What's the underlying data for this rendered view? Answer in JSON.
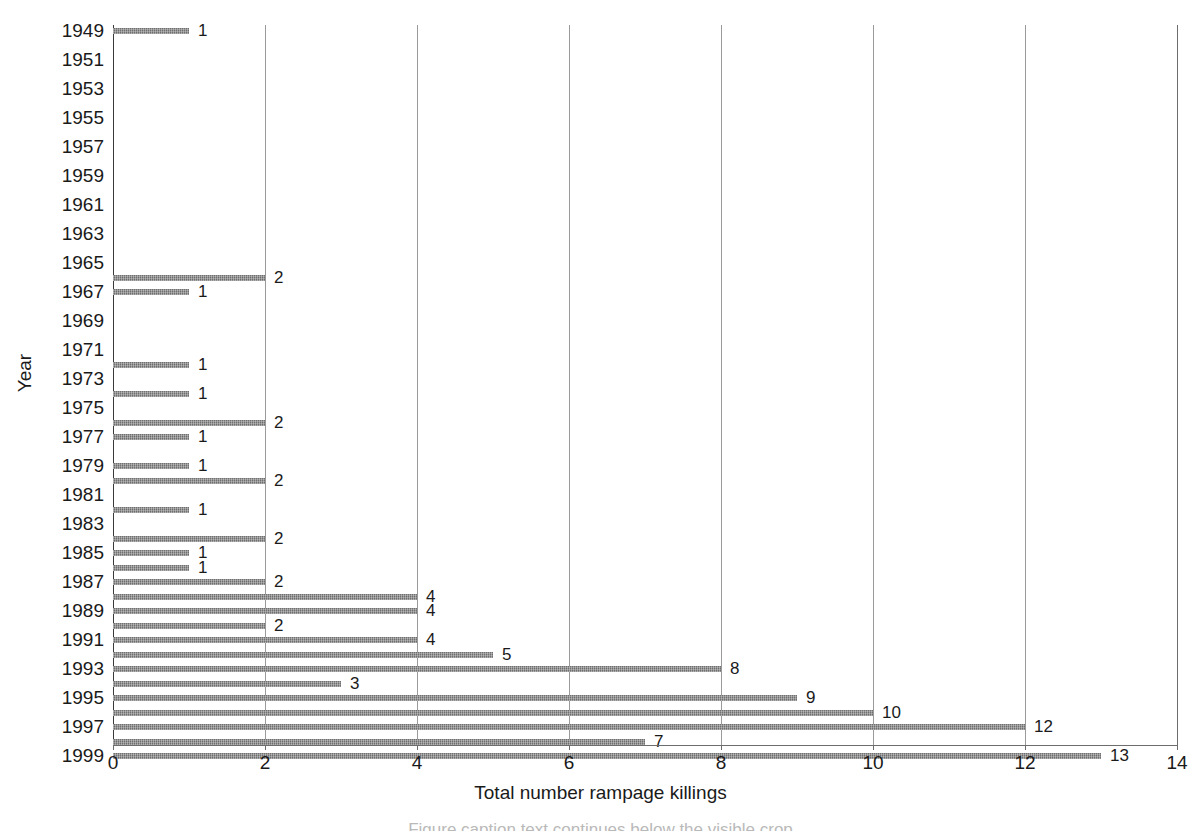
{
  "chart_data": {
    "type": "bar",
    "orientation": "horizontal",
    "title": "",
    "xlabel": "Total number rampage killings",
    "ylabel": "Year",
    "xlim": [
      0,
      14
    ],
    "ylim": [
      1949,
      1999
    ],
    "grid": true,
    "legend": false,
    "x_ticks": [
      0,
      2,
      4,
      6,
      8,
      10,
      12,
      14
    ],
    "x_tick_labels": [
      "0",
      "2",
      "4",
      "6",
      "8",
      "10",
      "12",
      "14"
    ],
    "y_tick_labels": [
      "1949",
      "1951",
      "1953",
      "1955",
      "1957",
      "1959",
      "1961",
      "1963",
      "1965",
      "1967",
      "1969",
      "1971",
      "1973",
      "1975",
      "1977",
      "1979",
      "1981",
      "1983",
      "1985",
      "1987",
      "1989",
      "1991",
      "1993",
      "1995",
      "1997",
      "1999"
    ],
    "bar_color": "#6f6f6f",
    "gridline_color": "#9a9a9a",
    "axis_color": "#6d6d6d",
    "categories": [
      "1949",
      "1950",
      "1951",
      "1952",
      "1953",
      "1954",
      "1955",
      "1956",
      "1957",
      "1958",
      "1959",
      "1960",
      "1961",
      "1962",
      "1963",
      "1964",
      "1965",
      "1966",
      "1967",
      "1968",
      "1969",
      "1970",
      "1971",
      "1972",
      "1973",
      "1974",
      "1975",
      "1976",
      "1977",
      "1978",
      "1979",
      "1980",
      "1981",
      "1982",
      "1983",
      "1984",
      "1985",
      "1986",
      "1987",
      "1988",
      "1989",
      "1990",
      "1991",
      "1992",
      "1993",
      "1994",
      "1995",
      "1996",
      "1997",
      "1998",
      "1999"
    ],
    "values": [
      1,
      0,
      0,
      0,
      0,
      0,
      0,
      0,
      0,
      0,
      0,
      0,
      0,
      0,
      0,
      0,
      0,
      2,
      1,
      0,
      0,
      0,
      0,
      1,
      0,
      1,
      0,
      2,
      1,
      0,
      1,
      2,
      0,
      1,
      0,
      2,
      1,
      1,
      2,
      4,
      4,
      2,
      4,
      5,
      8,
      3,
      9,
      10,
      12,
      7,
      13
    ],
    "data_labels": [
      "1",
      "",
      "",
      "",
      "",
      "",
      "",
      "",
      "",
      "",
      "",
      "",
      "",
      "",
      "",
      "",
      "",
      "2",
      "1",
      "",
      "",
      "",
      "",
      "1",
      "",
      "1",
      "",
      "2",
      "1",
      "",
      "1",
      "2",
      "",
      "1",
      "",
      "2",
      "1",
      "1",
      "2",
      "4",
      "4",
      "2",
      "4",
      "5",
      "8",
      "3",
      "9",
      "10",
      "12",
      "7",
      "13"
    ]
  },
  "caption": {
    "clipped_text": "Figure caption text continues below the visible crop"
  }
}
